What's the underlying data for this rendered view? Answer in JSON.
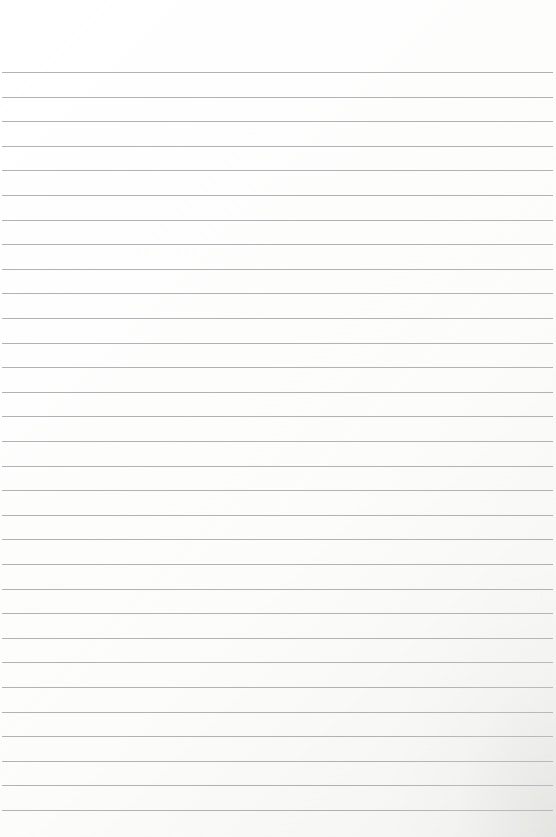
{
  "page": {
    "type": "lined-paper",
    "background_color": "#fcfcfb",
    "line_color": "#a4a4a4",
    "first_line_y": 72,
    "line_spacing": 24.6,
    "line_count": 31,
    "text": []
  }
}
